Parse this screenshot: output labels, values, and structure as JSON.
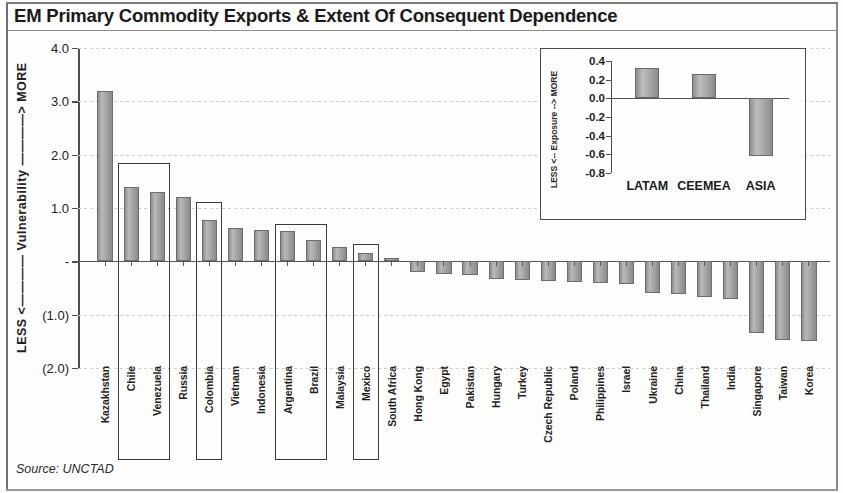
{
  "title": "EM Primary Commodity Exports & Extent Of Consequent Dependence",
  "source": "Source: UNCTAD",
  "axis": {
    "y_title": "LESS <———— Vulnerability ————> MORE",
    "y_ticks": [
      "4.0",
      "3.0",
      "2.0",
      "1.0",
      "-",
      "(1.0)",
      "(2.0)"
    ]
  },
  "inset": {
    "y_title": "LESS <-- Exposure --> MORE",
    "y_ticks": [
      "0.4",
      "0.2",
      "0.0",
      "-0.2",
      "-0.4",
      "-0.6",
      "-0.8"
    ]
  },
  "highlight_groups": [
    "Chile-Venezuela",
    "Colombia",
    "Argentina-Brazil",
    "Mexico"
  ],
  "chart_data": {
    "type": "bar",
    "title": "EM Primary Commodity Exports & Extent Of Consequent Dependence",
    "xlabel": "",
    "ylabel": "LESS <———— Vulnerability ————> MORE",
    "ylim": [
      -2.0,
      4.0
    ],
    "yticks": [
      4.0,
      3.0,
      2.0,
      1.0,
      0.0,
      -1.0,
      -2.0
    ],
    "ytick_labels": [
      "4.0",
      "3.0",
      "2.0",
      "1.0",
      "-",
      "(1.0)",
      "(2.0)"
    ],
    "grid": true,
    "legend": "none",
    "source": "Source: UNCTAD",
    "categories": [
      "Kazakhstan",
      "Chile",
      "Venezuela",
      "Russia",
      "Colombia",
      "Vietnam",
      "Indonesia",
      "Argentina",
      "Brazil",
      "Malaysia",
      "Mexico",
      "South Africa",
      "Hong Kong",
      "Egypt",
      "Pakistan",
      "Hungary",
      "Turkey",
      "Czech Republic",
      "Poland",
      "Philippines",
      "Israel",
      "Ukraine",
      "China",
      "Thailand",
      "India",
      "Singapore",
      "Taiwan",
      "Korea"
    ],
    "values": [
      3.2,
      1.4,
      1.3,
      1.2,
      0.78,
      0.63,
      0.58,
      0.57,
      0.4,
      0.27,
      0.15,
      0.06,
      -0.2,
      -0.23,
      -0.26,
      -0.34,
      -0.35,
      -0.36,
      -0.38,
      -0.4,
      -0.42,
      -0.6,
      -0.62,
      -0.66,
      -0.7,
      -1.35,
      -1.48,
      -1.5
    ],
    "highlighted": [
      "Chile",
      "Venezuela",
      "Colombia",
      "Argentina",
      "Brazil",
      "Mexico"
    ]
  },
  "inset_chart_data": {
    "type": "bar",
    "title": "",
    "ylabel": "LESS <-- Exposure --> MORE",
    "ylim": [
      -0.8,
      0.4
    ],
    "yticks": [
      0.4,
      0.2,
      0.0,
      -0.2,
      -0.4,
      -0.6,
      -0.8
    ],
    "ytick_labels": [
      "0.4",
      "0.2",
      "0.0",
      "-0.2",
      "-0.4",
      "-0.6",
      "-0.8"
    ],
    "grid": false,
    "categories": [
      "LATAM",
      "CEEMEA",
      "ASIA"
    ],
    "values": [
      0.32,
      0.26,
      -0.62
    ]
  }
}
